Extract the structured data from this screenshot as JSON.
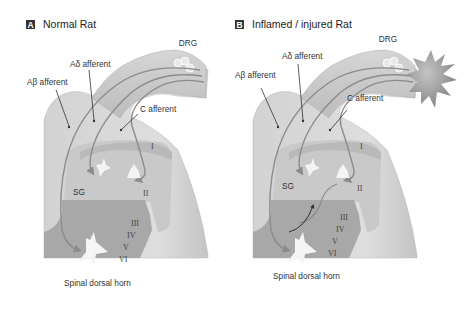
{
  "figure": {
    "colors": {
      "background": "#ffffff",
      "cord_outer": "#d9d9d9",
      "cord_edge": "#bdbdbd",
      "lamina_I_II": "#c8c8c8",
      "deep_laminae": "#a9a9a9",
      "fiber": "#8c8c8c",
      "neuron": "#f4f4f4",
      "injury": "#9a9a9a",
      "badge": "#333333"
    },
    "panels": [
      {
        "id": "A",
        "badge": "A",
        "title": "Normal Rat",
        "labels": {
          "drg": "DRG",
          "a_delta": "Aδ afferent",
          "a_beta": "Aβ afferent",
          "c_fiber": "C afferent",
          "sg": "SG",
          "horn": "Spinal dorsal horn"
        },
        "laminae": [
          "I",
          "II",
          "III",
          "IV",
          "V",
          "VI"
        ],
        "injury": false,
        "sprouting": false
      },
      {
        "id": "B",
        "badge": "B",
        "title": "Inflamed / injured Rat",
        "labels": {
          "drg": "DRG",
          "a_delta": "Aδ afferent",
          "a_beta": "Aβ afferent",
          "c_fiber": "C afferent",
          "sg": "SG",
          "horn": "Spinal dorsal horn"
        },
        "laminae": [
          "I",
          "II",
          "III",
          "IV",
          "V",
          "VI"
        ],
        "injury": true,
        "sprouting": true
      }
    ]
  }
}
